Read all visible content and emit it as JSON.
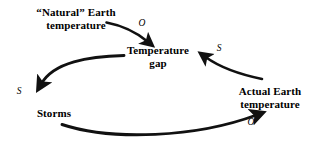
{
  "diagram": {
    "type": "causal-loop-diagram",
    "title": "",
    "background_color": "#ffffff",
    "stroke_color": "#000000",
    "nodes": [
      {
        "id": "natural",
        "label": "“Natural” Earth\ntemperature"
      },
      {
        "id": "gap",
        "label": "Temperature\ngap"
      },
      {
        "id": "actual",
        "label": "Actual Earth\ntemperature"
      },
      {
        "id": "storms",
        "label": "Storms"
      }
    ],
    "links": [
      {
        "id": "natural-to-gap",
        "from": "natural",
        "to": "gap",
        "label": "O"
      },
      {
        "id": "gap-to-storms",
        "from": "gap",
        "to": "storms",
        "label": "S"
      },
      {
        "id": "storms-to-actual",
        "from": "storms",
        "to": "actual",
        "label": "O"
      },
      {
        "id": "actual-to-gap",
        "from": "actual",
        "to": "gap",
        "label": "S"
      }
    ]
  }
}
